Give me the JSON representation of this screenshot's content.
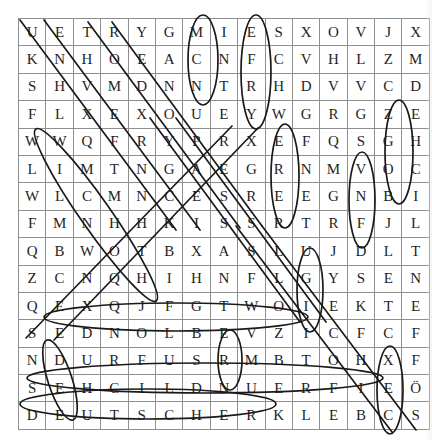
{
  "puzzle": {
    "type": "word-search",
    "rows": 15,
    "cols": 15,
    "grid": [
      [
        "U",
        "E",
        "T",
        "R",
        "Y",
        "G",
        "M",
        "I",
        "E",
        "S",
        "X",
        "O",
        "V",
        "J",
        "X"
      ],
      [
        "K",
        "N",
        "H",
        "O",
        "E",
        "A",
        "C",
        "N",
        "F",
        "C",
        "V",
        "H",
        "L",
        "Z",
        "M"
      ],
      [
        "S",
        "H",
        "V",
        "M",
        "D",
        "N",
        "N",
        "T",
        "R",
        "H",
        "D",
        "V",
        "V",
        "C",
        "D"
      ],
      [
        "F",
        "L",
        "X",
        "E",
        "X",
        "O",
        "U",
        "E",
        "Y",
        "W",
        "G",
        "R",
        "G",
        "Z",
        "E"
      ],
      [
        "W",
        "W",
        "Q",
        "F",
        "R",
        "Y",
        "P",
        "R",
        "X",
        "E",
        "F",
        "Q",
        "S",
        "G",
        "H"
      ],
      [
        "L",
        "I",
        "M",
        "T",
        "N",
        "G",
        "A",
        "E",
        "G",
        "R",
        "N",
        "M",
        "V",
        "O",
        "C"
      ],
      [
        "W",
        "L",
        "C",
        "M",
        "N",
        "C",
        "E",
        "S",
        "R",
        "E",
        "E",
        "G",
        "N",
        "B",
        "I"
      ],
      [
        "F",
        "M",
        "N",
        "H",
        "H",
        "K",
        "I",
        "S",
        "S",
        "R",
        "T",
        "R",
        "F",
        "J",
        "L"
      ],
      [
        "Q",
        "B",
        "W",
        "O",
        "T",
        "B",
        "X",
        "A",
        "S",
        "L",
        "U",
        "J",
        "D",
        "L",
        "T"
      ],
      [
        "Z",
        "C",
        "N",
        "Q",
        "H",
        "I",
        "H",
        "N",
        "F",
        "L",
        "G",
        "Y",
        "S",
        "E",
        "N"
      ],
      [
        "Q",
        "E",
        "X",
        "Q",
        "J",
        "F",
        "G",
        "T",
        "W",
        "O",
        "I",
        "E",
        "K",
        "T",
        "E"
      ],
      [
        "S",
        "E",
        "D",
        "N",
        "O",
        "L",
        "B",
        "E",
        "V",
        "Z",
        "I",
        "C",
        "F",
        "C",
        "F"
      ],
      [
        "N",
        "D",
        "U",
        "R",
        "F",
        "U",
        "S",
        "R",
        "M",
        "B",
        "T",
        "O",
        "H",
        "X",
        "F"
      ],
      [
        "S",
        "E",
        "H",
        "C",
        "I",
        "L",
        "D",
        "N",
        "U",
        "E",
        "R",
        "F",
        "I",
        "E",
        "Ö"
      ],
      [
        "D",
        "E",
        "U",
        "T",
        "S",
        "C",
        "H",
        "E",
        "R",
        "K",
        "L",
        "E",
        "B",
        "C",
        "S"
      ]
    ],
    "found_words": [
      "DEUTSCHER",
      "FREUNDLICHES",
      "BLONDES",
      "FRIEDENS",
      "SCHWARZ",
      "GROSSE"
    ],
    "colors": {
      "grid_line": "#8e8e8e",
      "grid_border": "#4a4a4a",
      "letter": "#1f1f1f",
      "annotation": "#1a1a1a",
      "page_background": "#ffffff"
    }
  },
  "annotations": {
    "marks": [
      {
        "name": "diagonal-line-1",
        "kind": "line"
      },
      {
        "name": "diagonal-line-2",
        "kind": "line"
      },
      {
        "name": "diagonal-line-3",
        "kind": "line"
      },
      {
        "name": "diagonal-line-4",
        "kind": "line"
      },
      {
        "name": "diagonal-line-5",
        "kind": "line"
      },
      {
        "name": "diagonal-line-6",
        "kind": "line"
      },
      {
        "name": "diagonal-line-7",
        "kind": "line"
      },
      {
        "name": "diagonal-line-8",
        "kind": "line"
      },
      {
        "name": "diagonal-line-9",
        "kind": "line"
      },
      {
        "name": "diagonal-line-10",
        "kind": "line"
      },
      {
        "name": "vertical-ellipse-column-8",
        "kind": "ellipse"
      },
      {
        "name": "vertical-ellipse-column-10",
        "kind": "ellipse"
      },
      {
        "name": "vertical-ellipse-column-15",
        "kind": "ellipse"
      },
      {
        "name": "vertical-ellipse-column-11",
        "kind": "ellipse"
      },
      {
        "name": "vertical-ellipse-column-14",
        "kind": "ellipse"
      },
      {
        "name": "horizontal-ellipse-row-12",
        "kind": "ellipse"
      },
      {
        "name": "horizontal-ellipse-row-14",
        "kind": "ellipse"
      },
      {
        "name": "horizontal-ellipse-row-15",
        "kind": "ellipse"
      },
      {
        "name": "long-diagonal-ellipse-left",
        "kind": "ellipse"
      }
    ]
  }
}
